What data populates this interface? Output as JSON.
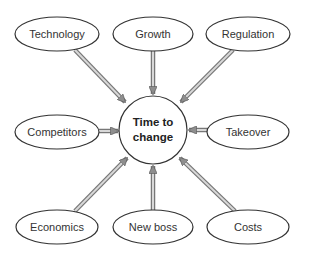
{
  "diagram": {
    "type": "hub-and-spoke",
    "center": {
      "label_line1": "Time to",
      "label_line2": "change",
      "x": 153,
      "y": 130,
      "r": 34
    },
    "nodes": [
      {
        "id": "technology",
        "label": "Technology",
        "x": 57,
        "y": 34
      },
      {
        "id": "growth",
        "label": "Growth",
        "x": 153,
        "y": 34
      },
      {
        "id": "regulation",
        "label": "Regulation",
        "x": 248,
        "y": 34
      },
      {
        "id": "competitors",
        "label": "Competitors",
        "x": 57,
        "y": 132
      },
      {
        "id": "takeover",
        "label": "Takeover",
        "x": 248,
        "y": 132
      },
      {
        "id": "economics",
        "label": "Economics",
        "x": 57,
        "y": 227
      },
      {
        "id": "new-boss",
        "label": "New boss",
        "x": 153,
        "y": 227
      },
      {
        "id": "costs",
        "label": "Costs",
        "x": 248,
        "y": 227
      }
    ],
    "edges_direction": "node-to-center",
    "colors": {
      "outline": "#333333",
      "arrow_fill": "#a8a8a8",
      "arrow_stroke": "#666666"
    }
  }
}
